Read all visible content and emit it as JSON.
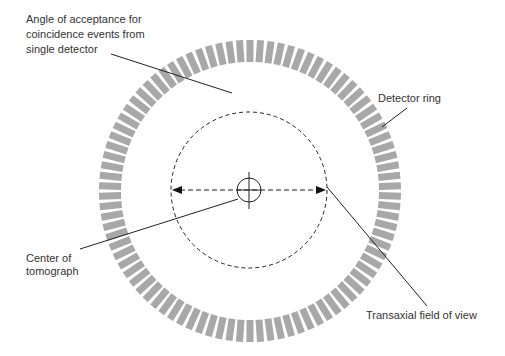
{
  "diagram": {
    "colors": {
      "background": "#ffffff",
      "detector": "#a8a8a8",
      "line": "#222222",
      "text": "#333333"
    },
    "ring": {
      "cx": 250,
      "cy": 191,
      "outer_r": 151,
      "inner_r": 129,
      "segments": 90,
      "segment_width": 7
    },
    "fov": {
      "cx": 249,
      "cy": 190,
      "r": 78
    },
    "center_marker": {
      "cx": 249,
      "cy": 190,
      "r": 13
    },
    "labels": {
      "angle_acceptance": [
        "Angle of acceptance for",
        "coincidence events from",
        "single detector"
      ],
      "detector_ring": "Detector ring",
      "center": [
        "Center of",
        "tomograph"
      ],
      "transaxial_fov": "Transaxial field of view"
    }
  }
}
